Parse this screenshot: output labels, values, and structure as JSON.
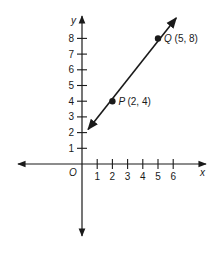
{
  "chart_data": {
    "type": "line",
    "title": "",
    "xlabel": "x",
    "ylabel": "y",
    "origin_label": "O",
    "xlim": [
      -4.2,
      8
    ],
    "ylim": [
      -4.5,
      9.5
    ],
    "x_ticks": [
      1,
      2,
      3,
      4,
      5,
      6
    ],
    "x_tick_labels": [
      "1",
      "2",
      "3",
      "4",
      "5",
      "6"
    ],
    "y_ticks": [
      1,
      2,
      3,
      4,
      5,
      6,
      7,
      8
    ],
    "y_tick_labels": [
      "1",
      "2",
      "3",
      "4",
      "5",
      "6",
      "7",
      "8"
    ],
    "grid": false,
    "legend": null,
    "series": [
      {
        "name": "line PQ",
        "style": "line with arrows at both ends",
        "x": [
          0.4,
          6.2
        ],
        "y": [
          2.2,
          9.3
        ]
      }
    ],
    "points": [
      {
        "name": "P",
        "x": 2,
        "y": 4,
        "label": "(2, 4)"
      },
      {
        "name": "Q",
        "x": 5,
        "y": 8,
        "label": "(5, 8)"
      }
    ],
    "colors": {
      "ink": "#1a1a1a",
      "background": "#ffffff"
    }
  }
}
